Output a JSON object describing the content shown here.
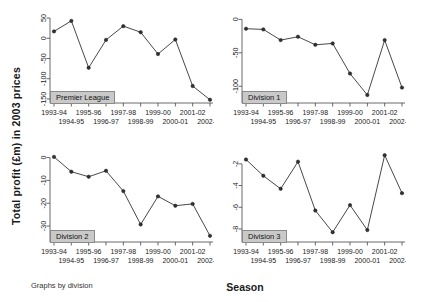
{
  "figure": {
    "ylabel": "Total profit (£m) in 2003 prices",
    "xlabel": "Season",
    "footnote": "Graphs by division"
  },
  "chart_data": {
    "type": "line",
    "title": "",
    "xlabel": "Season",
    "ylabel": "Total profit (£m) in 2003 prices",
    "annotation": "Graphs by division",
    "grid": false,
    "legend": "none",
    "categories": [
      "1993-94",
      "1994-95",
      "1995-96",
      "1996-97",
      "1997-98",
      "1998-99",
      "1999-00",
      "2000-01",
      "2001-02",
      "2002-03"
    ],
    "panels": [
      {
        "label": "Premier League",
        "position": "top-left",
        "ylim": [
          -160,
          60
        ],
        "yticks": [
          50,
          0,
          -50,
          -100,
          -150
        ],
        "ytick_labels": [
          "50",
          "0",
          "-50",
          "-100",
          "-150"
        ],
        "values": [
          17,
          43,
          -73,
          -4,
          30,
          15,
          -39,
          -3,
          -118,
          -152
        ]
      },
      {
        "label": "Division 1",
        "position": "top-right",
        "ylim": [
          -125,
          8
        ],
        "yticks": [
          0,
          -50,
          -100
        ],
        "ytick_labels": [
          "0",
          "-50",
          "-100"
        ],
        "values": [
          -14,
          -15,
          -31,
          -26,
          -38,
          -36,
          -81,
          -113,
          -31,
          -102
        ]
      },
      {
        "label": "Division 2",
        "position": "bottom-left",
        "ylim": [
          -37,
          2
        ],
        "yticks": [
          0,
          -10,
          -20,
          -30
        ],
        "ytick_labels": [
          "0",
          "-10",
          "-20",
          "-30"
        ],
        "values": [
          0.3,
          -6.2,
          -8.4,
          -5.8,
          -14.7,
          -29.3,
          -17.0,
          -21.1,
          -20.3,
          -34.3
        ]
      },
      {
        "label": "Division 3",
        "position": "bottom-right",
        "ylim": [
          -9.2,
          -1.0
        ],
        "yticks": [
          -2,
          -4,
          -6,
          -8
        ],
        "ytick_labels": [
          "-2",
          "-4",
          "-6",
          "-8"
        ],
        "values": [
          -1.6,
          -3.1,
          -4.3,
          -1.8,
          -6.3,
          -8.3,
          -5.8,
          -8.1,
          -1.2,
          -4.7
        ]
      }
    ]
  }
}
